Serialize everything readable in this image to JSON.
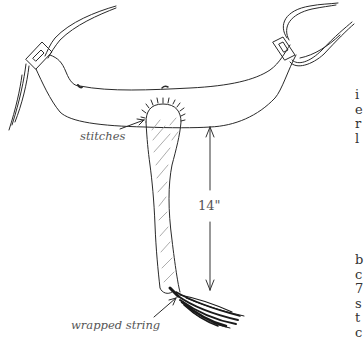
{
  "figure": {
    "type": "illustration",
    "labels": {
      "stitches": "stitches",
      "wrapped_string": "wrapped string",
      "length": "14\""
    }
  },
  "margin_text": {
    "block1": [
      "i",
      "e",
      "r",
      "l"
    ],
    "block2": [
      "b",
      "c",
      "7",
      "s",
      "t",
      "c"
    ]
  },
  "colors": {
    "ink": "#2a2a2a",
    "label": "#555555",
    "background": "#ffffff"
  }
}
